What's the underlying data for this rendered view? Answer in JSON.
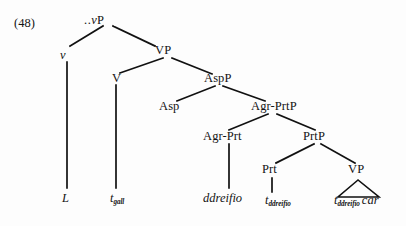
{
  "figure": {
    "example_number": "(48)",
    "type": "syntactic-tree",
    "language_sample": "Welsh",
    "line_color": "#111111",
    "background_color": "#fdfdfd",
    "text_color": "#141414"
  },
  "nodes": {
    "root": {
      "dots": "..",
      "label": "vP",
      "italic_part": "v"
    },
    "little_v": {
      "label": "v"
    },
    "vp_upper": {
      "label": "VP"
    },
    "v_head": {
      "label": "V"
    },
    "aspp": {
      "label": "AspP"
    },
    "asp": {
      "label": "Asp"
    },
    "agr_prtp": {
      "label": "Agr-PrtP"
    },
    "agr_prt": {
      "label": "Agr-Prt"
    },
    "prtp": {
      "label": "PrtP"
    },
    "prt": {
      "label": "Prt"
    },
    "vp_lower": {
      "label": "VP"
    }
  },
  "leaves": {
    "l_head": {
      "text": "L"
    },
    "t_gall": {
      "base": "t",
      "subscript": "gall"
    },
    "ddreifio": {
      "text": "ddreifio"
    },
    "t_ddreifio_prt": {
      "base": "t",
      "subscript": "ddreifio"
    },
    "t_ddreifio_vp": {
      "base": "t",
      "subscript": "ddreifio"
    },
    "car": {
      "text": "car"
    }
  },
  "triangle": {
    "name": "vp-triangle",
    "description": "elided-structure-triangle"
  }
}
